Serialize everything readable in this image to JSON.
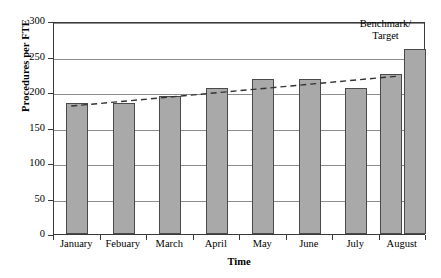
{
  "chart_data": {
    "type": "bar",
    "title": "",
    "xlabel": "Time",
    "ylabel": "Procedures per FTE",
    "ylim": [
      0,
      300
    ],
    "yticks": [
      0,
      50,
      100,
      150,
      200,
      250,
      300
    ],
    "grid": true,
    "legend": false,
    "categories": [
      "January",
      "Febuary",
      "March",
      "April",
      "May",
      "June",
      "July",
      "August"
    ],
    "series": [
      {
        "name": "Procedures per FTE",
        "values": [
          185,
          185,
          195,
          205,
          219,
          218,
          205,
          225
        ]
      },
      {
        "name": "Benchmark/Target",
        "values": [
          null,
          null,
          null,
          null,
          null,
          null,
          null,
          260
        ]
      }
    ],
    "trend_line": {
      "name": "trend",
      "style": "dashed",
      "color": "#333333",
      "points": [
        {
          "x": "January",
          "y": 183
        },
        {
          "x": "August",
          "y": 225
        }
      ]
    },
    "annotations": [
      {
        "name": "benchmark-target",
        "text": "Benchmark/\nTarget",
        "line1": "Benchmark/",
        "line2": "Target"
      }
    ]
  },
  "colors": {
    "bar_fill": "#a9a9a9",
    "bar_border": "#4a4a4a",
    "axis": "#3a3a3a",
    "grid": "#8d8d8d",
    "trend": "#333333"
  }
}
